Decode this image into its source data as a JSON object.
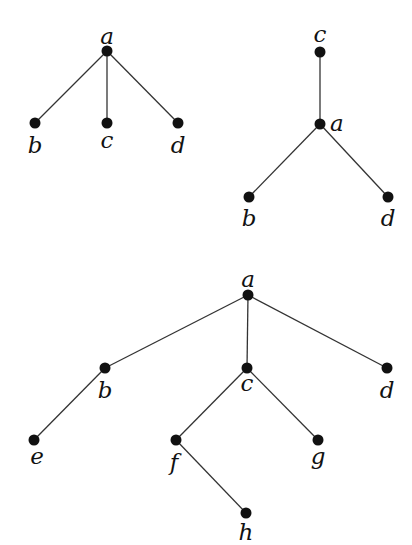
{
  "diagram": {
    "type": "rooted-trees",
    "colors": {
      "edge": "#333333",
      "node": "#111111",
      "background": "#ffffff"
    },
    "trees": [
      {
        "id": "tree1",
        "nodes": [
          {
            "id": "a",
            "label": "a",
            "x": 107,
            "y": 51,
            "lx": 107,
            "ly": 44,
            "anchor": "middle"
          },
          {
            "id": "b",
            "label": "b",
            "x": 35,
            "y": 123,
            "lx": 35,
            "ly": 153,
            "anchor": "middle"
          },
          {
            "id": "c",
            "label": "c",
            "x": 107,
            "y": 123,
            "lx": 107,
            "ly": 148,
            "anchor": "middle"
          },
          {
            "id": "d",
            "label": "d",
            "x": 178,
            "y": 123,
            "lx": 178,
            "ly": 153,
            "anchor": "middle"
          }
        ],
        "edges": [
          [
            "a",
            "b"
          ],
          [
            "a",
            "c"
          ],
          [
            "a",
            "d"
          ]
        ]
      },
      {
        "id": "tree2",
        "nodes": [
          {
            "id": "c",
            "label": "c",
            "x": 320,
            "y": 52,
            "lx": 320,
            "ly": 42,
            "anchor": "middle"
          },
          {
            "id": "a",
            "label": "a",
            "x": 320,
            "y": 124,
            "lx": 330,
            "ly": 131,
            "anchor": "start"
          },
          {
            "id": "b",
            "label": "b",
            "x": 249,
            "y": 197,
            "lx": 249,
            "ly": 226,
            "anchor": "middle"
          },
          {
            "id": "d",
            "label": "d",
            "x": 388,
            "y": 197,
            "lx": 388,
            "ly": 226,
            "anchor": "middle"
          }
        ],
        "edges": [
          [
            "c",
            "a"
          ],
          [
            "a",
            "b"
          ],
          [
            "a",
            "d"
          ]
        ]
      },
      {
        "id": "tree3",
        "nodes": [
          {
            "id": "a",
            "label": "a",
            "x": 248,
            "y": 295,
            "lx": 248,
            "ly": 287,
            "anchor": "middle"
          },
          {
            "id": "b",
            "label": "b",
            "x": 105,
            "y": 368,
            "lx": 105,
            "ly": 398,
            "anchor": "middle"
          },
          {
            "id": "c",
            "label": "c",
            "x": 247,
            "y": 368,
            "lx": 247,
            "ly": 391,
            "anchor": "middle"
          },
          {
            "id": "d",
            "label": "d",
            "x": 387,
            "y": 368,
            "lx": 387,
            "ly": 398,
            "anchor": "middle"
          },
          {
            "id": "e",
            "label": "e",
            "x": 34,
            "y": 440,
            "lx": 37,
            "ly": 464,
            "anchor": "middle"
          },
          {
            "id": "f",
            "label": "f",
            "x": 176,
            "y": 440,
            "lx": 174,
            "ly": 470,
            "anchor": "middle"
          },
          {
            "id": "g",
            "label": "g",
            "x": 318,
            "y": 440,
            "lx": 318,
            "ly": 464,
            "anchor": "middle"
          },
          {
            "id": "h",
            "label": "h",
            "x": 246,
            "y": 513,
            "lx": 246,
            "ly": 540,
            "anchor": "middle"
          }
        ],
        "edges": [
          [
            "a",
            "b"
          ],
          [
            "a",
            "c"
          ],
          [
            "a",
            "d"
          ],
          [
            "b",
            "e"
          ],
          [
            "c",
            "f"
          ],
          [
            "c",
            "g"
          ],
          [
            "f",
            "h"
          ]
        ]
      }
    ]
  }
}
